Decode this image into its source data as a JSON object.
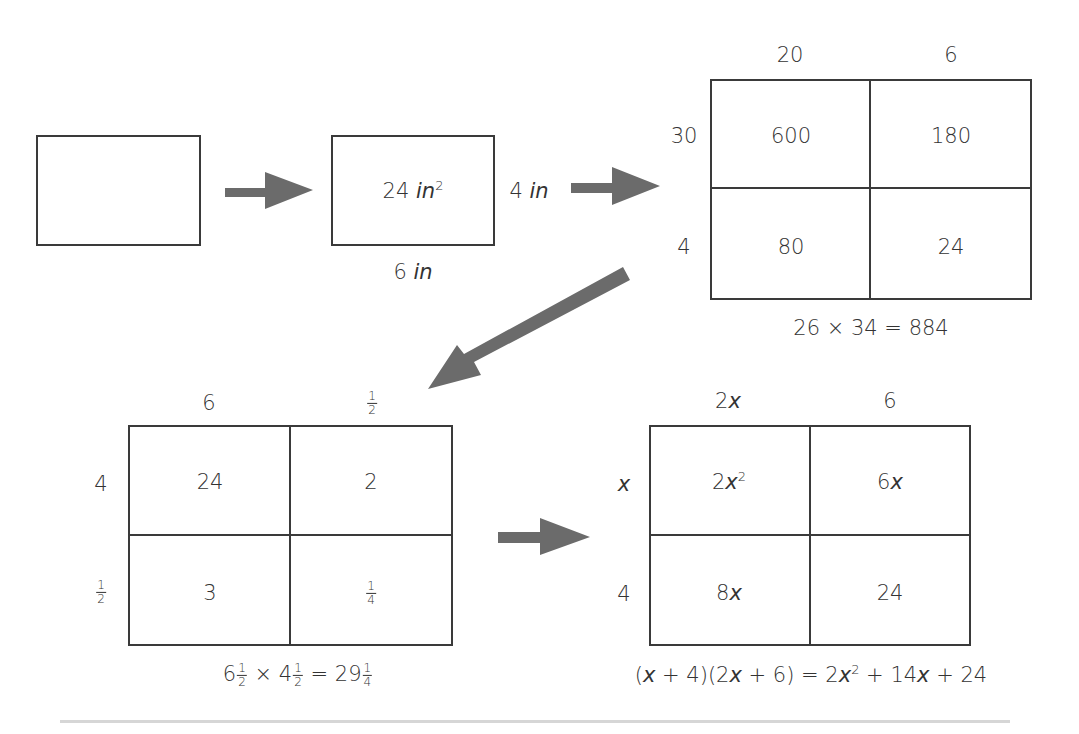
{
  "colors": {
    "stroke": "#3a3a3a",
    "text": "#333333",
    "arrow": "#6b6b6b",
    "rule": "#d6d6d6",
    "background": "#ffffff"
  },
  "step1": {
    "description": "empty rectangle"
  },
  "step2": {
    "area_value": "24",
    "area_unit": "in",
    "area_exponent": "2",
    "height_value": "4",
    "height_unit": "in",
    "width_value": "6",
    "width_unit": "in"
  },
  "grid_integers": {
    "col_headers": [
      "20",
      "6"
    ],
    "row_headers": [
      "30",
      "4"
    ],
    "cells": [
      [
        "600",
        "180"
      ],
      [
        "80",
        "24"
      ]
    ],
    "equation": "26 × 34 = 884"
  },
  "grid_fractions": {
    "col_headers": [
      {
        "whole": "6"
      },
      {
        "num": "1",
        "den": "2"
      }
    ],
    "row_headers": [
      {
        "whole": "4"
      },
      {
        "num": "1",
        "den": "2"
      }
    ],
    "cells": [
      [
        {
          "whole": "24"
        },
        {
          "whole": "2"
        }
      ],
      [
        {
          "whole": "3"
        },
        {
          "num": "1",
          "den": "4"
        }
      ]
    ],
    "equation": {
      "a_whole": "6",
      "a_num": "1",
      "a_den": "2",
      "times": "×",
      "b_whole": "4",
      "b_num": "1",
      "b_den": "2",
      "equals": "=",
      "c_whole": "29",
      "c_num": "1",
      "c_den": "4"
    }
  },
  "grid_algebra": {
    "col_headers": [
      {
        "coef": "2",
        "var": "x"
      },
      {
        "coef": "6",
        "var": ""
      }
    ],
    "row_headers": [
      {
        "coef": "",
        "var": "x"
      },
      {
        "coef": "4",
        "var": ""
      }
    ],
    "cells": [
      [
        {
          "coef": "2",
          "var": "x",
          "exp": "2"
        },
        {
          "coef": "6",
          "var": "x",
          "exp": ""
        }
      ],
      [
        {
          "coef": "8",
          "var": "x",
          "exp": ""
        },
        {
          "coef": "24",
          "var": "",
          "exp": ""
        }
      ]
    ],
    "equation": {
      "lhs_open1": "(",
      "lhs_x1": "x",
      "lhs_rest1": " + 4)(2",
      "lhs_x2": "x",
      "lhs_rest2": " + 6) = 2",
      "rhs_x1": "x",
      "rhs_exp": "2",
      "rhs_mid": " + 14",
      "rhs_x2": "x",
      "rhs_end": " + 24"
    }
  },
  "arrows": [
    {
      "name": "arrow-step1-to-step2",
      "direction": "right"
    },
    {
      "name": "arrow-step2-to-grid-integers",
      "direction": "right"
    },
    {
      "name": "arrow-grid-integers-to-grid-fractions",
      "direction": "down-left"
    },
    {
      "name": "arrow-grid-fractions-to-grid-algebra",
      "direction": "right"
    }
  ]
}
